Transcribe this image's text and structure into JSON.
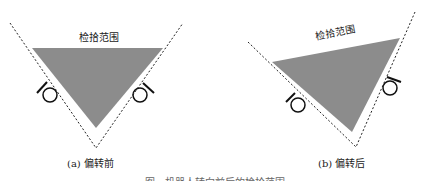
{
  "figure": {
    "caption_partial": "图 . 机器人转向前后的检拾范围"
  },
  "panels": [
    {
      "id": "a",
      "label": "(a) 偏转前",
      "range_label": "检拾范围",
      "range_rotation_deg": 0
    },
    {
      "id": "b",
      "label": "(b) 偏转后",
      "range_label": "检拾范围",
      "range_rotation_deg": -11
    }
  ],
  "colors": {
    "fill": "#8c8c8c",
    "line": "#222222",
    "background": "#ffffff"
  },
  "icons": [
    "sensor-icon",
    "sensor-icon",
    "sensor-icon",
    "sensor-icon"
  ]
}
